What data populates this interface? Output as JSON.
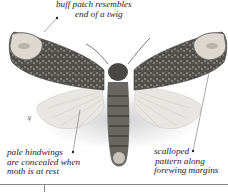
{
  "figure": {
    "subject": "moth",
    "sex_symbol": "♀",
    "annotations": [
      {
        "id": "top",
        "lines": [
          "buff patch resembles",
          "end of a twig"
        ]
      },
      {
        "id": "left",
        "lines": [
          "pale hindwings",
          "are concealed when",
          "moth is at rest"
        ]
      },
      {
        "id": "right",
        "lines": [
          "scalloped",
          "pattern along",
          "forewing margins"
        ]
      }
    ]
  },
  "colors": {
    "background": "#ffffff",
    "forewing": "#4a4a48",
    "hindwing": "#e6e4e0",
    "body": "#5a5854",
    "buff_patch": "#d9d4cc",
    "text": "#222222"
  }
}
